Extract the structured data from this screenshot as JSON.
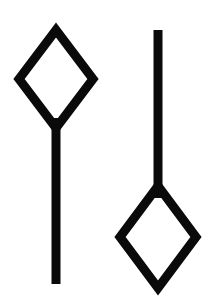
{
  "canvas": {
    "width": 209,
    "height": 301,
    "background_color": "#ffffff",
    "ink_color": "#0a0a0a",
    "description": "Two black outlined diamond-and-stem glyphs on a plain white background"
  },
  "figures": [
    {
      "id": "left-glyph",
      "name": "diamond-with-downward-stem",
      "orientation": "stem-below-diamond",
      "stroke_width": 9,
      "diamond": {
        "center_x": 56,
        "center_y": 79,
        "half_width": 37,
        "half_height": 49,
        "top_vertex": [
          56,
          30
        ],
        "right_vertex": [
          93,
          79
        ],
        "bottom_vertex": [
          56,
          128
        ],
        "left_vertex": [
          19,
          79
        ]
      },
      "stem": {
        "x": 56,
        "y_start": 118,
        "y_end": 284,
        "width": 9
      }
    },
    {
      "id": "right-glyph",
      "name": "diamond-with-upward-stem",
      "orientation": "stem-above-diamond",
      "stroke_width": 9,
      "diamond": {
        "center_x": 158,
        "center_y": 237,
        "half_width": 38,
        "half_height": 51,
        "top_vertex": [
          158,
          186
        ],
        "right_vertex": [
          196,
          237
        ],
        "bottom_vertex": [
          158,
          288
        ],
        "left_vertex": [
          120,
          237
        ]
      },
      "stem": {
        "x": 158,
        "y_start": 30,
        "y_end": 198,
        "width": 9
      }
    }
  ]
}
